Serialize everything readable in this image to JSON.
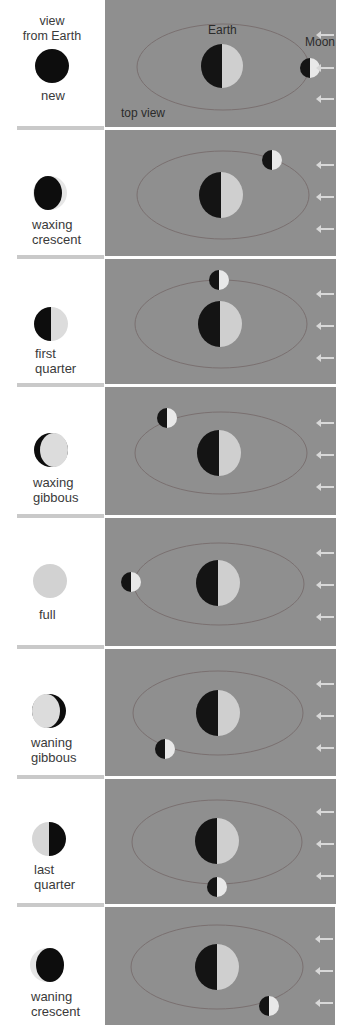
{
  "header": {
    "view_label": "view\nfrom Earth",
    "earth_label": "Earth",
    "moon_label": "Moon",
    "top_view_label": "top view"
  },
  "colors": {
    "panel_bg": "#8f8f8f",
    "orbit": "#7a7070",
    "dark": "#111111",
    "lit": "#d4d4d4",
    "page_bg": "#ffffff",
    "divider": "#c9c9c9"
  },
  "phases": [
    {
      "name": "new",
      "label_line1": "new",
      "label_line2": ""
    },
    {
      "name": "waxing crescent",
      "label_line1": "waxing",
      "label_line2": "crescent"
    },
    {
      "name": "first quarter",
      "label_line1": "first",
      "label_line2": "quarter"
    },
    {
      "name": "waxing gibbous",
      "label_line1": "waxing",
      "label_line2": "gibbous"
    },
    {
      "name": "full",
      "label_line1": "full",
      "label_line2": ""
    },
    {
      "name": "waning gibbous",
      "label_line1": "waning",
      "label_line2": "gibbous"
    },
    {
      "name": "last quarter",
      "label_line1": "last",
      "label_line2": "quarter"
    },
    {
      "name": "waning crescent",
      "label_line1": "waning",
      "label_line2": "crescent"
    }
  ]
}
